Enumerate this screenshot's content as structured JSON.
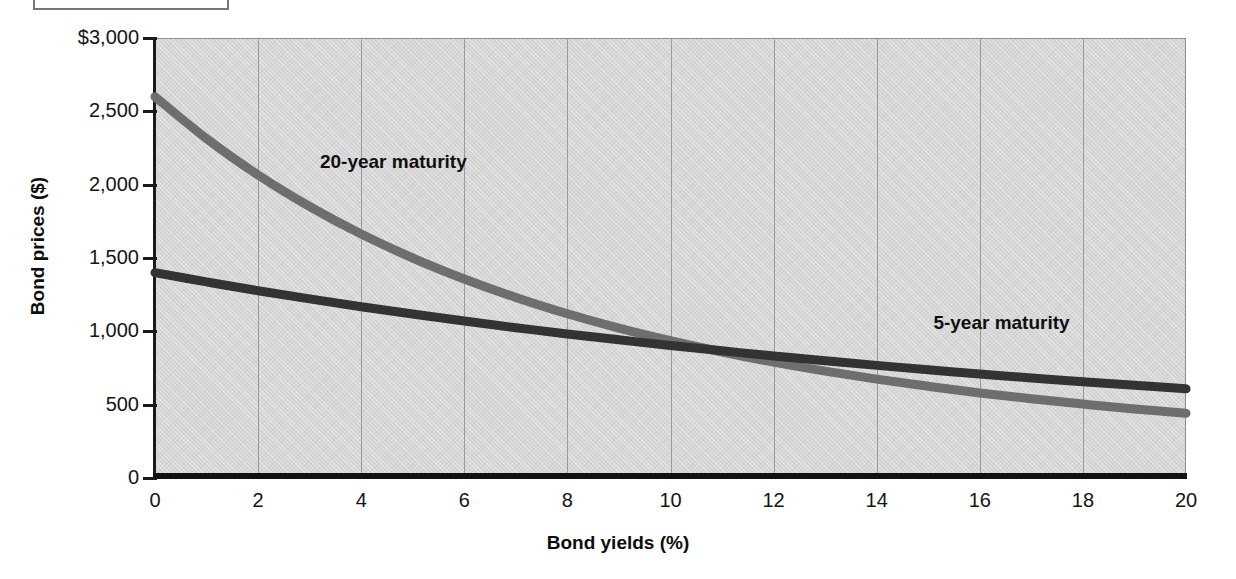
{
  "caption_box": {
    "visible": true,
    "text": ""
  },
  "chart_data": {
    "type": "line",
    "title": "",
    "xlabel": "Bond yields (%)",
    "ylabel": "Bond prices ($)",
    "xlim": [
      0,
      20
    ],
    "ylim": [
      0,
      3000
    ],
    "grid": false,
    "legend_position": "inline-annotation",
    "x_ticks": [
      "0",
      "2",
      "4",
      "6",
      "8",
      "10",
      "12",
      "14",
      "16",
      "18",
      "20"
    ],
    "x_tick_values": [
      0,
      2,
      4,
      6,
      8,
      10,
      12,
      14,
      16,
      18,
      20
    ],
    "y_ticks": [
      "$3,000",
      "2,500",
      "2,000",
      "1,500",
      "1,000",
      "500",
      "0"
    ],
    "y_tick_values": [
      3000,
      2500,
      2000,
      1500,
      1000,
      500,
      0
    ],
    "x": [
      0,
      1,
      2,
      3,
      4,
      5,
      6,
      7,
      8,
      9,
      10,
      11,
      12,
      13,
      14,
      15,
      16,
      17,
      18,
      19,
      20
    ],
    "series": [
      {
        "name": "20-year maturity",
        "color": "#6e6e6e",
        "label_x": 3.2,
        "label_y": 2150,
        "values": [
          2600,
          2314,
          2066,
          1851,
          1663,
          1500,
          1357,
          1231,
          1120,
          1022,
          936,
          859,
          790,
          729,
          674,
          625,
          580,
          540,
          504,
          471,
          441
        ]
      },
      {
        "name": "5-year maturity",
        "color": "#333333",
        "label_x": 15.1,
        "label_y": 1050,
        "values": [
          1400,
          1337,
          1277,
          1221,
          1168,
          1118,
          1070,
          1025,
          982,
          942,
          903,
          867,
          832,
          799,
          768,
          738,
          709,
          682,
          656,
          632,
          608
        ]
      }
    ],
    "crossing_point": {
      "x": 8,
      "y": 1000
    }
  }
}
